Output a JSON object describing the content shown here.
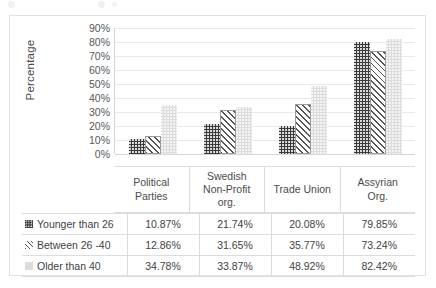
{
  "chart_data": {
    "type": "bar",
    "title": "",
    "xlabel": "",
    "ylabel": "Percentage",
    "ylim": [
      0,
      90
    ],
    "ytick_labels": [
      "90%",
      "80%",
      "70%",
      "60%",
      "50%",
      "40%",
      "30%",
      "20%",
      "10%",
      "0%"
    ],
    "ytick_values": [
      90,
      80,
      70,
      60,
      50,
      40,
      30,
      20,
      10,
      0
    ],
    "grid": true,
    "legend_position": "table-left",
    "categories": [
      "Political Parties",
      "Swedish Non-Profit org.",
      "Trade Union",
      "Assyrian Org."
    ],
    "series": [
      {
        "name": "Younger than 26",
        "marker": "dark-checkered-swatch",
        "color": "#3a3a3a",
        "values": [
          10.87,
          21.74,
          20.08,
          79.85
        ],
        "labels": [
          "10.87%",
          "21.74%",
          "20.08%",
          "79.85%"
        ]
      },
      {
        "name": "Between 26 -40",
        "marker": "diagonal-hatch-swatch",
        "color": "#555555",
        "values": [
          12.86,
          31.65,
          35.77,
          73.24
        ],
        "labels": [
          "12.86%",
          "31.65%",
          "35.77%",
          "73.24%"
        ]
      },
      {
        "name": "Older than 40",
        "marker": "light-gray-swatch",
        "color": "#dcdcdc",
        "values": [
          34.78,
          33.87,
          48.92,
          82.42
        ],
        "labels": [
          "34.78%",
          "33.87%",
          "48.92%",
          "82.42%"
        ]
      }
    ]
  },
  "axis": {
    "y_title": "Percentage"
  },
  "categories_display": [
    [
      "Political",
      "Parties"
    ],
    [
      "Swedish",
      "Non-Profit",
      "org."
    ],
    [
      "Trade Union"
    ],
    [
      "Assyrian",
      "Org."
    ]
  ]
}
